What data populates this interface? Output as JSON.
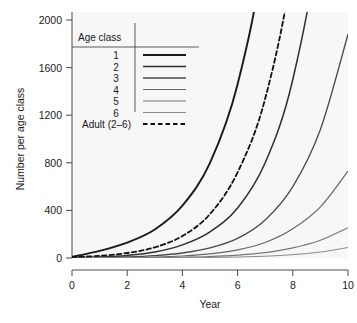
{
  "chart_data": {
    "type": "line",
    "title": "",
    "xlabel": "Year",
    "ylabel": "Number per age class",
    "xlim": [
      0,
      10
    ],
    "ylim": [
      0,
      2100
    ],
    "xticks": [
      0,
      2,
      4,
      6,
      8,
      10
    ],
    "xtick_labels": [
      "0",
      "2",
      "4",
      "6",
      "8",
      "10"
    ],
    "yticks": [
      0,
      400,
      800,
      1200,
      1600,
      2000
    ],
    "ytick_labels": [
      "0",
      "400",
      "800",
      "1200",
      "1600",
      "2000"
    ],
    "grid": false,
    "legend_position": "top-left-inside",
    "legend_title": "Age class",
    "x": [
      0,
      1,
      2,
      3,
      4,
      5,
      6,
      7,
      8,
      9,
      10
    ],
    "series": [
      {
        "name": "1",
        "label": "1",
        "color": "#1a1a1a",
        "width": 1.9,
        "dash": "none",
        "values": [
          10,
          60,
          130,
          240,
          440,
          800,
          1460,
          2650,
          4820,
          8770,
          15950
        ]
      },
      {
        "name": "2",
        "label": "2",
        "color": "#2e2e2e",
        "width": 1.5,
        "dash": "none",
        "values": [
          4,
          9,
          22,
          50,
          110,
          220,
          420,
          800,
          1500,
          2800,
          5200
        ]
      },
      {
        "name": "3",
        "label": "3",
        "color": "#4a4a4a",
        "width": 1.3,
        "dash": "none",
        "values": [
          2,
          4,
          9,
          20,
          42,
          85,
          165,
          320,
          600,
          1080,
          1880
        ]
      },
      {
        "name": "4",
        "label": "4",
        "color": "#666666",
        "width": 1.2,
        "dash": "none",
        "values": [
          1,
          2,
          4,
          8,
          17,
          35,
          68,
          130,
          245,
          430,
          730
        ]
      },
      {
        "name": "5",
        "label": "5",
        "color": "#777777",
        "width": 1.1,
        "dash": "none",
        "values": [
          0,
          1,
          2,
          3,
          6,
          12,
          24,
          45,
          85,
          150,
          255
        ]
      },
      {
        "name": "6",
        "label": "6",
        "color": "#8a8a8a",
        "width": 1.0,
        "dash": "none",
        "values": [
          0,
          0,
          1,
          1,
          2,
          4,
          8,
          15,
          28,
          50,
          88
        ]
      },
      {
        "name": "Adult (2-6)",
        "label": "Adult (2–6)",
        "color": "#111111",
        "width": 1.8,
        "dash": "dashed",
        "values": [
          8,
          18,
          42,
          90,
          185,
          370,
          720,
          1340,
          2480,
          4500,
          8100
        ]
      }
    ]
  },
  "axes": {
    "y_title": "Number per age class",
    "x_title": "Year",
    "y_labels": [
      "2000",
      "1600",
      "1200",
      "800",
      "400",
      "0"
    ],
    "x_labels": [
      "0",
      "2",
      "4",
      "6",
      "8",
      "10"
    ]
  },
  "legend": {
    "title": "Age class",
    "entries": [
      {
        "label": "1"
      },
      {
        "label": "2"
      },
      {
        "label": "3"
      },
      {
        "label": "4"
      },
      {
        "label": "5"
      },
      {
        "label": "6"
      },
      {
        "label": "Adult (2–6)"
      }
    ]
  },
  "colors": {
    "panel_background": "#f7f7f7",
    "page_background": "#ffffff",
    "axis": "#4a4a4a",
    "text": "#1a1a1a"
  }
}
